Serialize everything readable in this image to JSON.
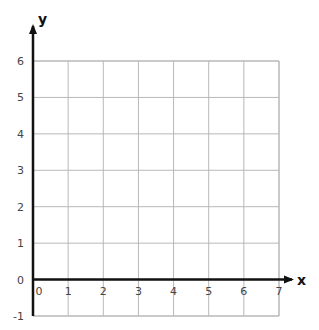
{
  "chart_data": {
    "type": "scatter",
    "title": "",
    "xlabel": "x",
    "ylabel": "y",
    "xlim": [
      0,
      7
    ],
    "ylim": [
      -1,
      6
    ],
    "grid": true,
    "x_ticks": [
      "0",
      "1",
      "2",
      "3",
      "4",
      "5",
      "6",
      "7"
    ],
    "y_ticks": [
      "-1",
      "0",
      "1",
      "2",
      "3",
      "4",
      "5",
      "6"
    ],
    "series": [],
    "legend": null
  },
  "colors": {
    "grid": "#b8b8b8",
    "axis": "#111111",
    "tick_text": "#444444"
  }
}
